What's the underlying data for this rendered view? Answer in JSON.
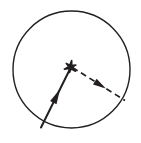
{
  "figure": {
    "canvas": {
      "width": 141,
      "height": 143
    },
    "background_color": "#ffffff",
    "stroke_color": "#231f20",
    "circle": {
      "label": "circle",
      "center_x": 71.5,
      "center_y": 69.5,
      "radius": 58.5,
      "stroke_width": 1.4,
      "fill": "none"
    },
    "center_marker": {
      "label": "center point star marker",
      "glyph": "star-marker",
      "x": 70.5,
      "y": 67.0,
      "size": 13,
      "color": "#231f20"
    },
    "vectors": [
      {
        "name": "solid-radius-vector",
        "style": "solid",
        "stroke_width": 2.0,
        "color": "#231f20",
        "from_x": 70.5,
        "from_y": 68.0,
        "to_x": 41.0,
        "to_y": 127.5,
        "arrow": {
          "name": "solid-vector-arrowhead",
          "position_t": 0.47,
          "direction": "toward-center",
          "length": 15,
          "half_width": 3.6
        }
      },
      {
        "name": "dashed-radius-vector",
        "style": "dashed",
        "stroke_width": 1.7,
        "dash_pattern": "6 4",
        "color": "#231f20",
        "from_x": 72.5,
        "from_y": 67.5,
        "to_x": 125.0,
        "to_y": 100.5,
        "arrow": {
          "name": "dashed-vector-arrowhead",
          "position_t": 0.53,
          "direction": "away-from-center",
          "length": 13,
          "half_width": 3.4
        }
      }
    ]
  }
}
